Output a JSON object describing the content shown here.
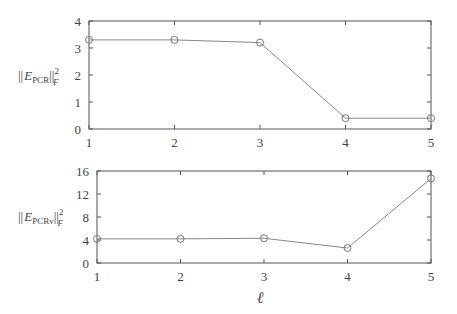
{
  "chart_data": [
    {
      "type": "line",
      "title": "",
      "xlabel": "",
      "ylabel": "||E_PCR||_F^2",
      "ylabel_parts": {
        "norm_open": "||",
        "E": "E",
        "sub": "PCR",
        "norm_close": "||",
        "sup": "2",
        "subF": "F"
      },
      "x": [
        1,
        2,
        3,
        4,
        5
      ],
      "series": [
        {
          "name": "PCR",
          "values": [
            3.3,
            3.3,
            3.2,
            0.4,
            0.4
          ],
          "marker": "circle"
        }
      ],
      "xlim": [
        1,
        5
      ],
      "ylim": [
        0,
        4
      ],
      "xticks": [
        "1",
        "2",
        "3",
        "4",
        "5"
      ],
      "yticks": [
        "0",
        "1",
        "2",
        "3",
        "4"
      ],
      "grid": false
    },
    {
      "type": "line",
      "title": "",
      "xlabel": "ℓ",
      "ylabel": "||E_PCRv||_F^2",
      "ylabel_parts": {
        "norm_open": "||",
        "E": "E",
        "sub": "PCRv",
        "norm_close": "||",
        "sup": "2",
        "subF": "F"
      },
      "x": [
        1,
        2,
        3,
        4,
        5
      ],
      "series": [
        {
          "name": "PCRv",
          "values": [
            4.2,
            4.2,
            4.3,
            2.6,
            14.7
          ],
          "marker": "circle"
        }
      ],
      "xlim": [
        1,
        5
      ],
      "ylim": [
        0,
        16
      ],
      "xticks": [
        "1",
        "2",
        "3",
        "4",
        "5"
      ],
      "yticks": [
        "0",
        "4",
        "8",
        "12",
        "16"
      ],
      "grid": false
    }
  ],
  "colors": {
    "axis": "#555555",
    "line": "#888888",
    "marker": "#777777",
    "text": "#444444"
  }
}
